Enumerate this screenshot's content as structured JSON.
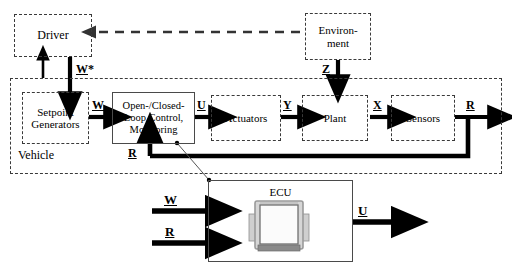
{
  "diagram": {
    "type": "block-diagram",
    "blocks": [
      {
        "id": "driver",
        "label": "Driver",
        "border": "dashed"
      },
      {
        "id": "environment",
        "label": "Environ-\nment",
        "border": "dashed"
      },
      {
        "id": "setpoint",
        "label": "Setpoint\nGenerators",
        "border": "dashed"
      },
      {
        "id": "control",
        "label": "Open-/Closed-\nLoop Control,\nMonitoring",
        "border": "solid"
      },
      {
        "id": "actuators",
        "label": "Actuators",
        "border": "dashed"
      },
      {
        "id": "plant",
        "label": "Plant",
        "border": "dashed"
      },
      {
        "id": "sensors",
        "label": "Sensors",
        "border": "dashed"
      },
      {
        "id": "vehicle",
        "label": "Vehicle",
        "border": "dashed"
      },
      {
        "id": "ecu",
        "label": "ECU",
        "border": "solid"
      }
    ],
    "block_text": {
      "driver": "Driver",
      "environment_line1": "Environ-",
      "environment_line2": "ment",
      "setpoint_line1": "Setpoint",
      "setpoint_line2": "Generators",
      "control_line1": "Open-/Closed-",
      "control_line2": "Loop Control,",
      "control_line3": "Monitoring",
      "actuators": "Actuators",
      "plant": "Plant",
      "sensors": "Sensors",
      "vehicle": "Vehicle",
      "ecu": "ECU"
    },
    "signals": {
      "w_star": "W*",
      "w_star_base": "W",
      "w_star_sup": "*",
      "z": "Z",
      "w_vehicle": "W",
      "u_vehicle": "U",
      "y": "Y",
      "x": "X",
      "r_sensors": "R",
      "r_feedback": "R",
      "w_ecu": "W",
      "r_ecu": "R",
      "u_ecu": "U"
    },
    "edges": [
      {
        "from": "environment",
        "to": "driver",
        "label": "",
        "style": "dashed-arrow",
        "direction": "left"
      },
      {
        "from": "environment",
        "to": "vehicle",
        "label": "Z",
        "style": "thick-arrow",
        "direction": "down"
      },
      {
        "from": "driver",
        "to": "setpoint",
        "label": "W*",
        "style": "thick-arrow",
        "direction": "down"
      },
      {
        "from": "vehicle",
        "to": "driver",
        "label": "",
        "style": "thin-arrow",
        "direction": "up"
      },
      {
        "from": "setpoint",
        "to": "control",
        "label": "W",
        "style": "thick-arrow",
        "direction": "right"
      },
      {
        "from": "control",
        "to": "actuators",
        "label": "U",
        "style": "thick-arrow",
        "direction": "right"
      },
      {
        "from": "actuators",
        "to": "plant",
        "label": "Y",
        "style": "thick-arrow",
        "direction": "right"
      },
      {
        "from": "plant",
        "to": "sensors",
        "label": "X",
        "style": "thick-arrow",
        "direction": "right"
      },
      {
        "from": "sensors",
        "to": "output",
        "label": "R",
        "style": "thick-arrow",
        "direction": "right"
      },
      {
        "from": "sensors",
        "to": "control",
        "label": "R",
        "style": "thick-feedback",
        "direction": "left-up"
      },
      {
        "from": "input-w",
        "to": "ecu",
        "label": "W",
        "style": "thick-arrow",
        "direction": "right"
      },
      {
        "from": "input-r",
        "to": "ecu",
        "label": "R",
        "style": "thick-arrow",
        "direction": "right"
      },
      {
        "from": "ecu",
        "to": "output-u",
        "label": "U",
        "style": "thick-arrow",
        "direction": "right"
      },
      {
        "from": "control",
        "to": "ecu",
        "label": "",
        "style": "leader-line",
        "direction": "down-right"
      }
    ],
    "colors": {
      "stroke": "#000000",
      "dashed_border": "#3a3a3a",
      "solid_border": "#4a4a4a",
      "background": "#ffffff",
      "ecu_photo_body": "#d9d9d9",
      "ecu_photo_shadow": "#8a8a8a"
    }
  }
}
